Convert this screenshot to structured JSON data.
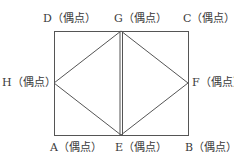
{
  "diagram": {
    "type": "graph-figure",
    "line_color": "#555555",
    "vertices": [
      {
        "id": "A",
        "label": "A（偶点）",
        "x": 54,
        "y": 135
      },
      {
        "id": "B",
        "label": "B（偶点）",
        "x": 188,
        "y": 135
      },
      {
        "id": "C",
        "label": "C（偶点）",
        "x": 188,
        "y": 31
      },
      {
        "id": "D",
        "label": "D（偶点）",
        "x": 54,
        "y": 31
      },
      {
        "id": "E",
        "label": "E（偶点）",
        "x": 121,
        "y": 135
      },
      {
        "id": "F",
        "label": "F（偶点）",
        "x": 188,
        "y": 83
      },
      {
        "id": "G",
        "label": "G（偶点）",
        "x": 121,
        "y": 31
      },
      {
        "id": "H",
        "label": "H（偶点）",
        "x": 54,
        "y": 83
      }
    ],
    "edges": [
      [
        "A",
        "E"
      ],
      [
        "E",
        "B"
      ],
      [
        "B",
        "F"
      ],
      [
        "F",
        "C"
      ],
      [
        "C",
        "G"
      ],
      [
        "G",
        "D"
      ],
      [
        "D",
        "H"
      ],
      [
        "H",
        "A"
      ],
      [
        "G",
        "E"
      ],
      [
        "G",
        "E"
      ],
      [
        "H",
        "G"
      ],
      [
        "H",
        "E"
      ],
      [
        "G",
        "F"
      ],
      [
        "E",
        "F"
      ]
    ]
  }
}
